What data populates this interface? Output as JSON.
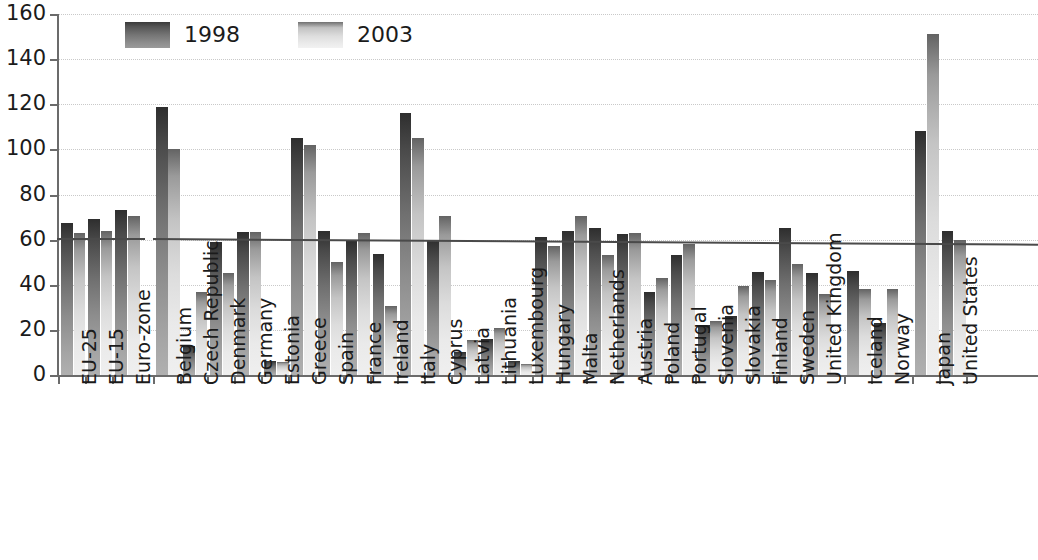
{
  "chart_data": {
    "type": "bar",
    "title": "",
    "subtitle": "",
    "xlabel": "",
    "ylabel": "",
    "ylim": [
      0,
      160
    ],
    "ytick_step": 20,
    "yticks": [
      "0",
      "20",
      "40",
      "60",
      "80",
      "100",
      "120",
      "140",
      "160"
    ],
    "grid": true,
    "legend_position": "top-left",
    "categories": [
      "EU-25",
      "EU-15",
      "Euro-zone",
      "Belgium",
      "Czech Republic",
      "Denmark",
      "Germany",
      "Estonia",
      "Greece",
      "Spain",
      "France",
      "Ireland",
      "Italy",
      "Cyprus",
      "Latvia",
      "Lithuania",
      "Luxembourg",
      "Hungary",
      "Malta",
      "Netherlands",
      "Austria",
      "Poland",
      "Portugal",
      "Slovenia",
      "Slovakia",
      "Finland",
      "Sweden",
      "United Kingdom",
      "Iceland",
      "Norway",
      "Japan",
      "United States"
    ],
    "group_breaks_after": [
      "Euro-zone",
      "United Kingdom",
      "Norway"
    ],
    "series": [
      {
        "name": "1998",
        "color": "#6f6f6f",
        "values": [
          67.5,
          69,
          73,
          119,
          13,
          59,
          63.5,
          6.4,
          105,
          64,
          59.5,
          53.5,
          116,
          60,
          10,
          16,
          6.4,
          61,
          64,
          65,
          62.5,
          37,
          53,
          22,
          26,
          45.5,
          65,
          45,
          46,
          23,
          108,
          64
        ]
      },
      {
        "name": "2003",
        "color": "#d8d8d8",
        "values": [
          63,
          64,
          70.5,
          100,
          37,
          45,
          63.5,
          5.8,
          102,
          50,
          63,
          30.5,
          105,
          70.5,
          15.5,
          21,
          5,
          57,
          70.5,
          53,
          63,
          43,
          58,
          24,
          39.5,
          42,
          49,
          36,
          38,
          38,
          151,
          60
        ]
      }
    ],
    "reference_line": {
      "label": "EU-25 average",
      "start_value": 60.5,
      "end_value": 58.0,
      "color": "#4a4a4a"
    }
  },
  "legend": {
    "items": [
      {
        "label": "1998",
        "swatch": "y1998"
      },
      {
        "label": "2003",
        "swatch": "y2003"
      }
    ]
  }
}
